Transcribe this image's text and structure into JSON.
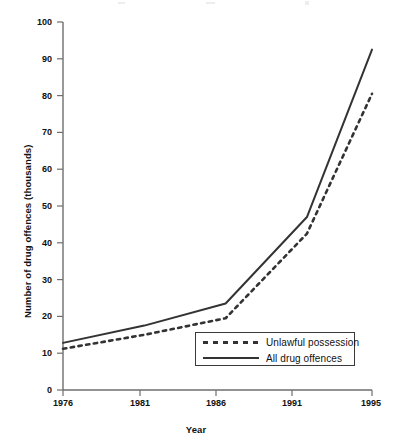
{
  "chart_data": {
    "type": "line",
    "title": "",
    "xlabel": "Year",
    "ylabel": "Number of drug offences (thousands)",
    "x": [
      1976,
      1981,
      1986,
      1991,
      1995
    ],
    "xtick_labels": [
      "1976",
      "1981",
      "1986",
      "1991",
      "1995"
    ],
    "ytick_labels": [
      "0",
      "10",
      "20",
      "30",
      "40",
      "50",
      "60",
      "70",
      "80",
      "90",
      "100"
    ],
    "yticks": [
      0,
      10,
      20,
      30,
      40,
      50,
      60,
      70,
      80,
      90,
      100
    ],
    "xlim": [
      1976,
      1995
    ],
    "ylim": [
      0,
      100
    ],
    "grid": false,
    "legend_position": "lower right",
    "series": [
      {
        "name": "Unlawful possession",
        "style": "dotted",
        "color": "#333333",
        "values": [
          11.2,
          15.0,
          19.5,
          42.5,
          80.5
        ]
      },
      {
        "name": "All drug offences",
        "style": "solid",
        "color": "#333333",
        "values": [
          12.8,
          17.5,
          23.5,
          47.0,
          92.5
        ]
      }
    ]
  },
  "axes": {
    "y_title": "Number of drug offences (thousands)",
    "x_title": "Year"
  },
  "legend": {
    "entries": [
      {
        "label": "Unlawful possession",
        "style": "dotted"
      },
      {
        "label": "All drug offences",
        "style": "solid"
      }
    ]
  }
}
